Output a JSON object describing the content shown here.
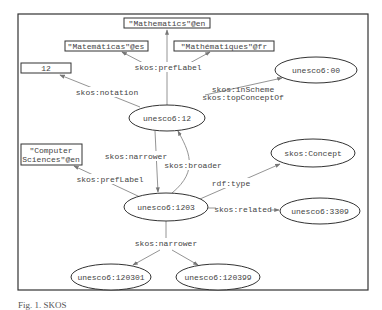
{
  "diagram": {
    "nodes": [
      {
        "id": "math_en",
        "label": "\"Mathematics\"@en",
        "shape": "rect",
        "x": 124,
        "y": 18,
        "w": 86,
        "h": 10
      },
      {
        "id": "math_es",
        "label": "\"Matemáticas\"@es",
        "shape": "rect",
        "x": 65,
        "y": 41,
        "w": 83,
        "h": 10
      },
      {
        "id": "math_fr",
        "label": "\"Mathématiques\"@fr",
        "shape": "rect",
        "x": 174,
        "y": 41,
        "w": 100,
        "h": 10
      },
      {
        "id": "notation12",
        "label": "12",
        "shape": "rect",
        "x": 21,
        "y": 63,
        "w": 50,
        "h": 10
      },
      {
        "id": "unesco6_00",
        "label": "unesco6:00",
        "shape": "ellipse",
        "cx": 316,
        "cy": 70,
        "rx": 41,
        "ry": 13
      },
      {
        "id": "unesco6_12",
        "label": "unesco6:12",
        "shape": "ellipse",
        "cx": 159,
        "cy": 118,
        "rx": 33,
        "ry": 13
      },
      {
        "id": "cs_en",
        "label_lines": [
          "\"Computer",
          "Sciences\"@en"
        ],
        "shape": "rect",
        "x": 21,
        "y": 144,
        "w": 61,
        "h": 21
      },
      {
        "id": "skos_concept",
        "label": "skos:Concept",
        "shape": "ellipse",
        "cx": 313,
        "cy": 153,
        "rx": 42,
        "ry": 14
      },
      {
        "id": "unesco6_1203",
        "label": "unesco6:1203",
        "shape": "ellipse",
        "cx": 166,
        "cy": 207,
        "rx": 42,
        "ry": 14
      },
      {
        "id": "unesco6_3309",
        "label": "unesco6:3309",
        "shape": "ellipse",
        "cx": 320,
        "cy": 211,
        "rx": 40,
        "ry": 13
      },
      {
        "id": "unesco6_120301",
        "label": "unesco6:120301",
        "shape": "ellipse",
        "cx": 111,
        "cy": 277,
        "rx": 40,
        "ry": 13
      },
      {
        "id": "unesco6_120399",
        "label": "unesco6:120399",
        "shape": "ellipse",
        "cx": 218,
        "cy": 277,
        "rx": 42,
        "ry": 13
      }
    ],
    "edge_labels": {
      "prefLabel_top": "skos:prefLabel",
      "notation": "skos:notation",
      "inScheme": "skos:inScheme",
      "topConceptOf": "skos:topConceptOf",
      "narrower_1": "skos:narrower",
      "broader": "skos:broader",
      "prefLabel_cs": "skos:prefLabel",
      "rdf_type": "rdf:type",
      "related": "skos:related",
      "narrower_2": "skos:narrower"
    }
  },
  "caption": "Fig. 1. SKOS"
}
